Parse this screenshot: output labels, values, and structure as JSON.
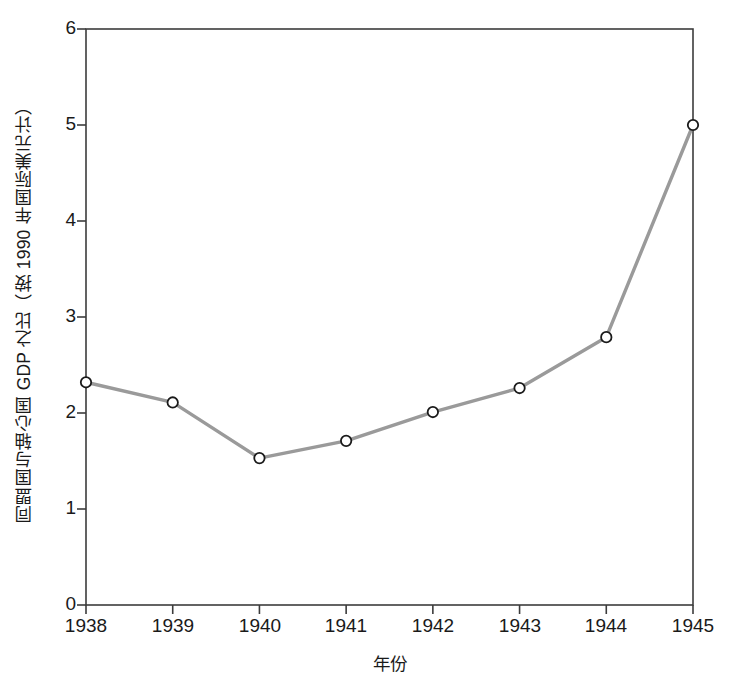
{
  "chart_data": {
    "type": "line",
    "title": "",
    "xlabel": "年份",
    "ylabel": "同盟国与轴心国 GDP 之比（按 1990 年国际美元计）",
    "categories": [
      "1938",
      "1939",
      "1940",
      "1941",
      "1942",
      "1943",
      "1944",
      "1945"
    ],
    "x": [
      1938,
      1939,
      1940,
      1941,
      1942,
      1943,
      1944,
      1945
    ],
    "values": [
      2.32,
      2.11,
      1.53,
      1.71,
      2.01,
      2.26,
      2.79,
      5.0
    ],
    "series": [
      {
        "name": "同盟国与轴心国 GDP 之比",
        "values": [
          2.32,
          2.11,
          1.53,
          1.71,
          2.01,
          2.26,
          2.79,
          5.0
        ]
      }
    ],
    "xlim": [
      1938,
      1945
    ],
    "ylim": [
      0,
      6
    ],
    "yticks": [
      "0",
      "1",
      "2",
      "3",
      "4",
      "5",
      "6"
    ],
    "ytick_values": [
      0,
      1,
      2,
      3,
      4,
      5,
      6
    ],
    "xticks": [
      "1938",
      "1939",
      "1940",
      "1941",
      "1942",
      "1943",
      "1944",
      "1945"
    ],
    "grid": false,
    "legend": "none",
    "line_color": "#9a9a9a",
    "marker": "circle-open",
    "marker_edge_color": "#1a1a1a",
    "marker_face_color": "#ffffff",
    "axis_color": "#3c3c3c",
    "background_color": "#ffffff"
  }
}
